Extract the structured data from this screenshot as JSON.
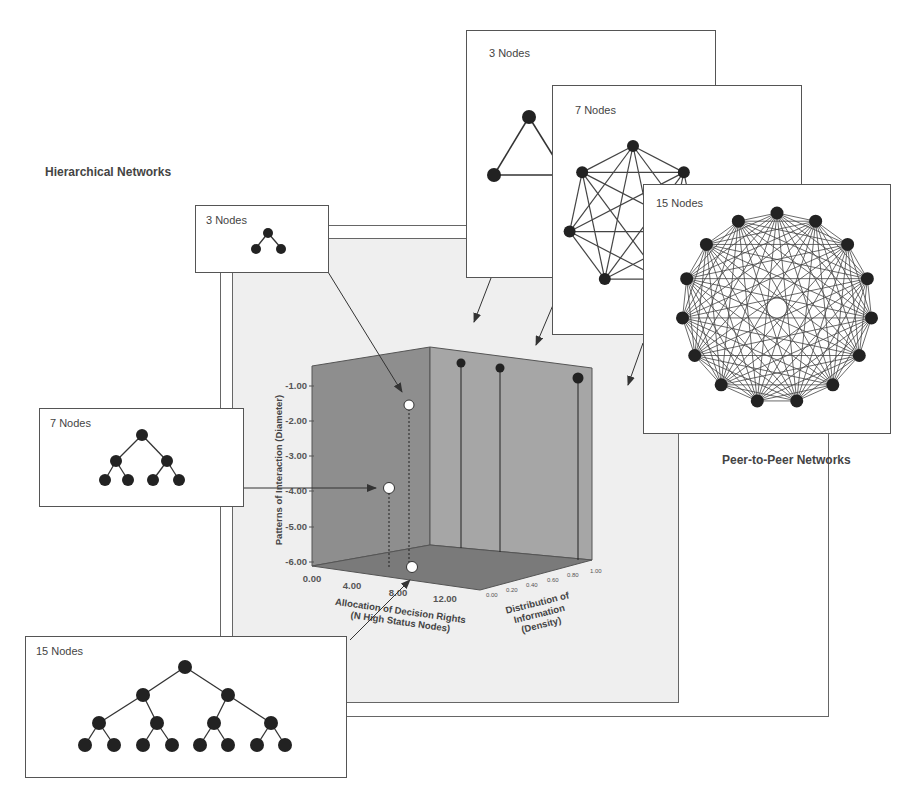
{
  "headings": {
    "hierarchical": "Hierarchical Networks",
    "peer_to_peer": "Peer-to-Peer Networks"
  },
  "hierarchical_cards": [
    {
      "label": "3 Nodes",
      "nodes": 3
    },
    {
      "label": "7 Nodes",
      "nodes": 7
    },
    {
      "label": "15 Nodes",
      "nodes": 15
    }
  ],
  "p2p_cards": [
    {
      "label": "3 Nodes",
      "nodes": 3
    },
    {
      "label": "7 Nodes",
      "nodes": 7
    },
    {
      "label": "15 Nodes",
      "nodes": 15
    }
  ],
  "chart": {
    "y_axis_title": "Patterns of Interaction (Diameter)",
    "x_axis_title_line1": "Allocation of Decision Rights",
    "x_axis_title_line2": "(N High Status Nodes)",
    "z_axis_title_line1": "Distribution of",
    "z_axis_title_line2": "Information",
    "z_axis_title_line3": "(Density)",
    "y_ticks": [
      "-1.00",
      "-2.00",
      "-3.00",
      "-4.00",
      "-5.00",
      "-6.00"
    ],
    "x_ticks": [
      "0.00",
      "4.00",
      "8.00",
      "12.00"
    ],
    "z_ticks": [
      "0.00",
      "0.20",
      "0.40",
      "0.60",
      "0.80",
      "1.00"
    ]
  },
  "colors": {
    "panel_bg": "#efefef",
    "cube_left_wall": "#8e8e8e",
    "cube_right_wall": "#a6a6a6",
    "cube_floor": "#7a7a7a",
    "node_fill": "#222222",
    "hier_point_fill": "#ffffff"
  },
  "chart_data": {
    "type": "scatter",
    "title": "",
    "xlabel": "Allocation of Decision Rights (N High Status Nodes)",
    "ylabel": "Patterns of Interaction (Diameter)",
    "zlabel": "Distribution of Information (Density)",
    "xlim": [
      0,
      14
    ],
    "ylim": [
      -6,
      -0.5
    ],
    "zlim": [
      0,
      1
    ],
    "grid": false,
    "series": [
      {
        "name": "Hierarchical Networks",
        "marker": "white circle",
        "points": [
          {
            "label": "3 Nodes",
            "x": 1,
            "y": -2.0,
            "z": 0.67
          },
          {
            "label": "7 Nodes",
            "x": 3,
            "y": -4.0,
            "z": 0.29
          },
          {
            "label": "15 Nodes",
            "x": 7,
            "y": -6.0,
            "z": 0.13
          }
        ]
      },
      {
        "name": "Peer-to-Peer Networks",
        "marker": "black circle",
        "points": [
          {
            "label": "3 Nodes",
            "x": 3,
            "y": -1.0,
            "z": 1.0
          },
          {
            "label": "7 Nodes",
            "x": 7,
            "y": -1.0,
            "z": 1.0
          },
          {
            "label": "15 Nodes",
            "x": 15,
            "y": -1.0,
            "z": 1.0
          }
        ]
      }
    ]
  }
}
